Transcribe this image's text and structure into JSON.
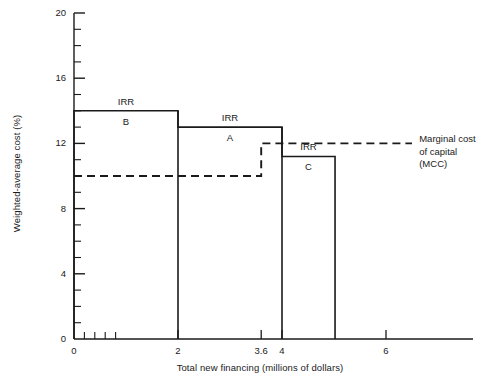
{
  "chart_data": {
    "type": "line",
    "title": "",
    "xlabel": "Total new financing (millions of dollars)",
    "ylabel": "Weighted-average cost (%)",
    "xlim": [
      0,
      7
    ],
    "ylim": [
      0,
      20
    ],
    "grid": false,
    "legend_position": "right-inline-annotation",
    "x_ticks": [
      0,
      2,
      3.6,
      4,
      6
    ],
    "x_tick_labels": [
      "0",
      "2",
      "3.6",
      "4",
      "6"
    ],
    "x_minor_tick_interval": 0.2,
    "y_ticks": [
      0,
      4,
      8,
      12,
      16,
      20
    ],
    "y_tick_labels": [
      "0",
      "4",
      "8",
      "12",
      "16",
      "20"
    ],
    "y_minor_tick_interval": 1,
    "series": [
      {
        "name": "IRR schedule",
        "style": "solid",
        "steps": [
          {
            "label_line1": "IRR",
            "label_line2": "B",
            "x_start": 0,
            "x_end": 2,
            "value": 14.0
          },
          {
            "label_line1": "IRR",
            "label_line2": "A",
            "x_start": 2,
            "x_end": 4,
            "value": 13.0
          },
          {
            "label_line1": "IRR",
            "label_line2": "C",
            "x_start": 4,
            "x_end": 5.02,
            "value": 11.2
          }
        ]
      },
      {
        "name": "Marginal cost of capital (MCC)",
        "style": "dashed",
        "steps": [
          {
            "x_start": 0,
            "x_end": 3.6,
            "value": 10.0
          },
          {
            "x_start": 3.6,
            "x_end": 6.5,
            "value": 12.0
          }
        ]
      }
    ],
    "annotations": [
      {
        "name": "mcc-callout",
        "text": "Marginal cost\nof capital\n(MCC)",
        "x": 6.6,
        "y": 12.0
      }
    ]
  },
  "colors": {
    "line": "#1a1a1a",
    "axis": "#1a1a1a",
    "background": "#ffffff"
  }
}
